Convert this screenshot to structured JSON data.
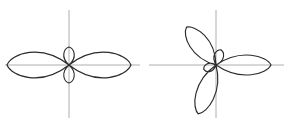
{
  "figure": {
    "background_color": "#ffffff",
    "axis_color": "#9a9a9a",
    "curve_color": "#2b2b2b",
    "panel_count": 2,
    "caption": ""
  },
  "chart_data": [
    {
      "type": "line",
      "plot_kind": "polar-rose",
      "title": "",
      "subtitle": "",
      "xlabel": "",
      "ylabel": "",
      "grid": false,
      "legend": null,
      "panel_label": "",
      "center_px": [
        69,
        65
      ],
      "axes": {
        "horizontal_extent_px": [
          5,
          140
        ],
        "vertical_extent_px": [
          10,
          118
        ],
        "ticks": [],
        "tick_labels": []
      },
      "equation": "r = cos(2θ)",
      "petal_count": 4,
      "petals": [
        {
          "angle_deg": 0,
          "length_px": 62,
          "width_px": 22,
          "size": "large"
        },
        {
          "angle_deg": 180,
          "length_px": 62,
          "width_px": 22,
          "size": "large"
        },
        {
          "angle_deg": 90,
          "length_px": 18,
          "width_px": 9,
          "size": "small"
        },
        {
          "angle_deg": 270,
          "length_px": 18,
          "width_px": 9,
          "size": "small"
        }
      ],
      "theta_start_deg": 0,
      "theta_end_deg": 360,
      "r_max": 62,
      "series": [
        {
          "name": "rose-4-petal",
          "values": [
            62,
            18,
            62,
            18
          ]
        }
      ],
      "categories": [
        "0deg",
        "90deg",
        "180deg",
        "270deg"
      ]
    },
    {
      "type": "line",
      "plot_kind": "polar-rose",
      "title": "",
      "subtitle": "",
      "xlabel": "",
      "ylabel": "",
      "grid": false,
      "legend": null,
      "panel_label": "",
      "center_px": [
        72,
        65
      ],
      "axes": {
        "horizontal_extent_px": [
          5,
          140
        ],
        "vertical_extent_px": [
          10,
          118
        ],
        "ticks": [],
        "tick_labels": []
      },
      "equation": "r = cos(2.5θ)",
      "petal_count": 5,
      "petals": [
        {
          "angle_deg": 0,
          "length_px": 55,
          "width_px": 17,
          "size": "large"
        },
        {
          "angle_deg": 72,
          "length_px": 16,
          "width_px": 8,
          "size": "small"
        },
        {
          "angle_deg": 128,
          "length_px": 48,
          "width_px": 16,
          "size": "large"
        },
        {
          "angle_deg": 200,
          "length_px": 13,
          "width_px": 7,
          "size": "small"
        },
        {
          "angle_deg": 250,
          "length_px": 52,
          "width_px": 16,
          "size": "large"
        }
      ],
      "theta_start_deg": 0,
      "theta_end_deg": 720,
      "r_max": 55,
      "series": [
        {
          "name": "rose-5-petal",
          "values": [
            55,
            16,
            48,
            13,
            52
          ]
        }
      ],
      "categories": [
        "0deg",
        "72deg",
        "128deg",
        "200deg",
        "250deg"
      ]
    }
  ]
}
